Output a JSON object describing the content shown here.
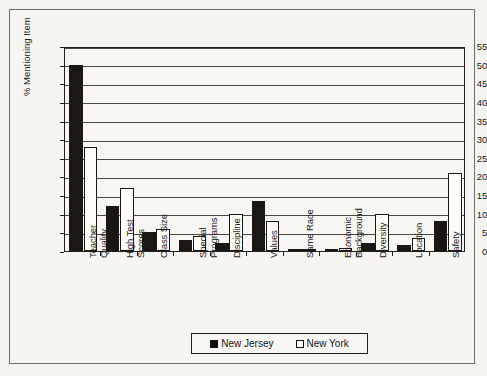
{
  "chart_data": {
    "type": "bar",
    "title": "",
    "xlabel": "",
    "ylabel": "% Mentioning Item",
    "ylim": [
      0,
      55
    ],
    "ytick_step": 5,
    "yticks": [
      0,
      5,
      10,
      15,
      20,
      25,
      30,
      35,
      40,
      45,
      50,
      55
    ],
    "grid": true,
    "legend_position": "bottom",
    "categories": [
      "Teacher Quality",
      "High Test Scores",
      "Class Size",
      "Special Programs",
      "Discipline",
      "Values",
      "Same Race",
      "Economic Background",
      "Diversity",
      "Location",
      "Safety"
    ],
    "category_lines": [
      [
        "Teacher",
        "Quality"
      ],
      [
        "High Test",
        "Scores"
      ],
      [
        "Class Size"
      ],
      [
        "Special",
        "Programs"
      ],
      [
        "Discipline"
      ],
      [
        "Values"
      ],
      [
        "Same Race"
      ],
      [
        "Economic",
        "Background"
      ],
      [
        "Diversity"
      ],
      [
        "Location"
      ],
      [
        "Safety"
      ]
    ],
    "series": [
      {
        "name": "New Jersey",
        "color": "#1a1613",
        "values": [
          50,
          12,
          5,
          3,
          2.2,
          13.5,
          0.5,
          0.6,
          2.2,
          1.5,
          8
        ]
      },
      {
        "name": "New York",
        "color": "#fcfbf7",
        "values": [
          28,
          17,
          6,
          4,
          10,
          8,
          0.4,
          0.7,
          10,
          3.5,
          21
        ]
      }
    ]
  },
  "legend": {
    "entries": [
      {
        "label": "New Jersey",
        "swatch": "filled-black-square"
      },
      {
        "label": "New York",
        "swatch": "outlined-white-square"
      }
    ]
  },
  "axis": {
    "y_label": "% Mentioning Item",
    "y_tick_labels": [
      "55",
      "50",
      "45",
      "40",
      "35",
      "30",
      "25",
      "20",
      "15",
      "10",
      "5",
      "0"
    ]
  }
}
